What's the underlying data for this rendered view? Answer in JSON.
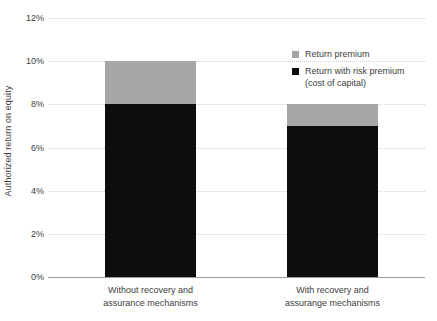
{
  "chart_data": {
    "type": "bar",
    "stacked": true,
    "title": "",
    "xlabel": "",
    "ylabel": "Authorized return on equity",
    "ylim": [
      0,
      12
    ],
    "ytick_values": [
      0,
      2,
      4,
      6,
      8,
      10,
      12
    ],
    "ytick_labels": [
      "0%",
      "2%",
      "4%",
      "6%",
      "8%",
      "10%",
      "12%"
    ],
    "grid": true,
    "legend_position": "top-right",
    "categories": [
      "Without recovery and\nassurance mechanisms",
      "With recovery and\nassurange mechanisms"
    ],
    "series": [
      {
        "name": "Return with risk premium\n(cost of capital)",
        "color": "#0d0d0d",
        "values": [
          8,
          7
        ]
      },
      {
        "name": "Return premium",
        "color": "#a6a6a6",
        "values": [
          2,
          1
        ]
      }
    ],
    "stack_tops": [
      10,
      8
    ]
  },
  "legend": {
    "items": [
      {
        "label": "Return premium",
        "color": "#a6a6a6"
      },
      {
        "label": "Return with risk premium\n(cost of capital)",
        "color": "#0d0d0d"
      }
    ]
  }
}
